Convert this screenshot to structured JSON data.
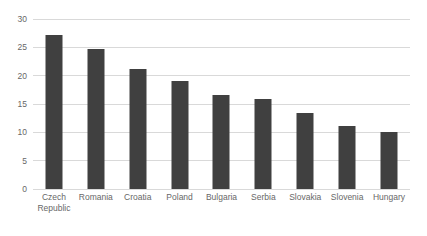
{
  "chart_data": {
    "type": "bar",
    "title": "",
    "subtitle": "",
    "xlabel": "",
    "ylabel": "",
    "ylim": [
      0,
      30
    ],
    "ytick_step": 5,
    "yticks": [
      "0",
      "5",
      "10",
      "15",
      "20",
      "25",
      "30"
    ],
    "grid": "horizontal",
    "legend": "none",
    "categories": [
      "Czech Republic",
      "Romania",
      "Croatia",
      "Poland",
      "Bulgaria",
      "Serbia",
      "Slovakia",
      "Slovenia",
      "Hungary"
    ],
    "category_lines": [
      [
        "Czech",
        "Republic"
      ],
      [
        "Romania"
      ],
      [
        "Croatia"
      ],
      [
        "Poland"
      ],
      [
        "Bulgaria"
      ],
      [
        "Serbia"
      ],
      [
        "Slovakia"
      ],
      [
        "Slovenia"
      ],
      [
        "Hungary"
      ]
    ],
    "values": [
      27.1,
      24.7,
      21.2,
      19.1,
      16.6,
      15.8,
      13.4,
      11.2,
      10.0
    ],
    "series": [
      {
        "name": "",
        "values": [
          27.1,
          24.7,
          21.2,
          19.1,
          16.6,
          15.8,
          13.4,
          11.2,
          10.0
        ]
      }
    ],
    "colors": {
      "bar": "#404040",
      "gridline": "#d9d9d9",
      "tick_text": "#676767",
      "background": "#ffffff"
    }
  }
}
